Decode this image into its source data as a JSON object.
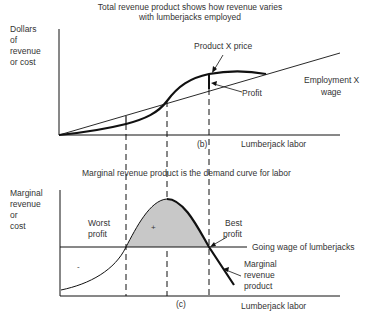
{
  "top_panel": {
    "title_line1": "Total revenue product shows how revenue varies",
    "title_line2": "with lumberjacks employed",
    "ylabel": [
      "Dollars",
      "of",
      "revenue",
      "or cost"
    ],
    "xlabel": "Lumberjack labor",
    "panel_tag": "(b)",
    "labels": {
      "product_price": "Product X price",
      "profit": "Profit",
      "employment_wage_line1": "Employment X",
      "employment_wage_line2": "wage"
    }
  },
  "bottom_panel": {
    "title": "Marginal revenue product is the demand curve for labor",
    "ylabel": [
      "Marginal",
      "revenue",
      "or",
      "cost"
    ],
    "xlabel": "Lumberjack labor",
    "panel_tag": "(c)",
    "labels": {
      "worst_profit_line1": "Worst",
      "worst_profit_line2": "profit",
      "best_profit_line1": "Best",
      "best_profit_line2": "profit",
      "going_wage": "Going wage of lumberjacks",
      "mrp_line1": "Marginal",
      "mrp_line2": "revenue",
      "mrp_line3": "product",
      "plus_sign": "+",
      "minus_sign": "-"
    }
  },
  "colors": {
    "ink": "#111111",
    "shading": "#c8c8c8"
  }
}
